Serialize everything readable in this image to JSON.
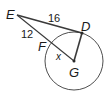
{
  "diagram": {
    "type": "geometry-circle-tangent-secant",
    "colors": {
      "stroke": "#3a3a3a",
      "text": "#1a1a1a",
      "background": "#ffffff"
    },
    "circle": {
      "center_label": "G",
      "cx": 74,
      "cy": 61,
      "r": 29
    },
    "points": [
      {
        "label": "E",
        "x": 17,
        "y": 15,
        "lx": 6,
        "ly": 19
      },
      {
        "label": "D",
        "x": 82,
        "y": 33,
        "lx": 81,
        "ly": 31
      },
      {
        "label": "F",
        "x": 51,
        "y": 45,
        "lx": 38,
        "ly": 51
      },
      {
        "label": "G",
        "x": 74,
        "y": 61,
        "lx": 69,
        "ly": 77
      }
    ],
    "segments": [
      {
        "from": "E",
        "to": "D",
        "label": "16",
        "lx": 48,
        "ly": 22
      },
      {
        "from": "E",
        "to": "F",
        "label": "12",
        "lx": 21,
        "ly": 38
      },
      {
        "from": "F",
        "to": "G",
        "label": "x",
        "lx": 56,
        "ly": 60
      },
      {
        "from": "D",
        "to": "G",
        "label": ""
      }
    ]
  }
}
